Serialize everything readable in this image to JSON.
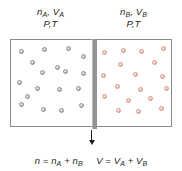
{
  "figure": {
    "labels": {
      "left": {
        "line1": "nA, VA",
        "line1_parts": {
          "n": "n",
          "n_sub": "A",
          "sep": ", ",
          "v": "V",
          "v_sub": "A"
        },
        "line2": "P,T"
      },
      "right": {
        "line1": "nB, VB",
        "line1_parts": {
          "n": "n",
          "n_sub": "B",
          "sep": ", ",
          "v": "V",
          "v_sub": "B"
        },
        "line2": "P,T"
      }
    },
    "arrow": {
      "direction": "down",
      "symbol": "↓"
    },
    "equations": {
      "moles": {
        "full": "n = nA + nB",
        "lhs": "n",
        "equals": " = ",
        "term1": "n",
        "term1_sub": "A",
        "plus": " + ",
        "term2": "n",
        "term2_sub": "B"
      },
      "volume": {
        "full": "V = VA + VB",
        "lhs": "V",
        "equals": " = ",
        "term1": "V",
        "term1_sub": "A",
        "plus": " + ",
        "term2": "V",
        "term2_sub": "B"
      }
    },
    "colors": {
      "gas_a_particle": "#9d9da1",
      "gas_b_particle": "#e0a491",
      "container_border": "#8a8a8d",
      "divider": "#939397",
      "text": "#231f20",
      "background": "#ffffff"
    },
    "chamber_a": {
      "name": "Gas A",
      "particle_color": "gray",
      "particle_count": 18,
      "particles": [
        {
          "x": 8,
          "y": 9
        },
        {
          "x": 31,
          "y": 7
        },
        {
          "x": 55,
          "y": 6
        },
        {
          "x": 70,
          "y": 14
        },
        {
          "x": 19,
          "y": 20
        },
        {
          "x": 44,
          "y": 25
        },
        {
          "x": 29,
          "y": 30
        },
        {
          "x": 52,
          "y": 29
        },
        {
          "x": 70,
          "y": 31
        },
        {
          "x": 6,
          "y": 40
        },
        {
          "x": 24,
          "y": 46
        },
        {
          "x": 46,
          "y": 47
        },
        {
          "x": 65,
          "y": 46
        },
        {
          "x": 8,
          "y": 62
        },
        {
          "x": 30,
          "y": 67
        },
        {
          "x": 48,
          "y": 68
        },
        {
          "x": 68,
          "y": 63
        },
        {
          "x": 14,
          "y": 54
        }
      ]
    },
    "chamber_b": {
      "name": "Gas B",
      "particle_color": "salmon",
      "particle_count": 18,
      "particles": [
        {
          "x": 6,
          "y": 10
        },
        {
          "x": 25,
          "y": 8
        },
        {
          "x": 43,
          "y": 9
        },
        {
          "x": 65,
          "y": 6
        },
        {
          "x": 22,
          "y": 22
        },
        {
          "x": 56,
          "y": 20
        },
        {
          "x": 5,
          "y": 33
        },
        {
          "x": 37,
          "y": 32
        },
        {
          "x": 64,
          "y": 34
        },
        {
          "x": 19,
          "y": 44
        },
        {
          "x": 42,
          "y": 47
        },
        {
          "x": 68,
          "y": 46
        },
        {
          "x": 6,
          "y": 54
        },
        {
          "x": 30,
          "y": 58
        },
        {
          "x": 52,
          "y": 56
        },
        {
          "x": 20,
          "y": 68
        },
        {
          "x": 40,
          "y": 69
        },
        {
          "x": 63,
          "y": 66
        }
      ]
    }
  }
}
